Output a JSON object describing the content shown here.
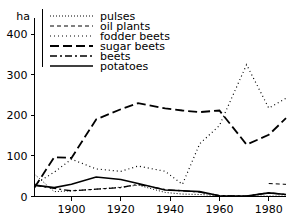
{
  "chart_data": {
    "type": "line",
    "title": "",
    "xlabel": "",
    "ylabel": "ha",
    "unit_label": "ha",
    "xlim": [
      1885,
      1987
    ],
    "ylim": [
      0,
      440
    ],
    "grid": false,
    "legend_position": "top-left",
    "xticks": [
      1900,
      1920,
      1940,
      1960,
      1980
    ],
    "xtick_labels": [
      "1900",
      "1920",
      "1940",
      "1960",
      "1980"
    ],
    "yticks": [
      0,
      100,
      200,
      300,
      400
    ],
    "ytick_labels": [
      "0",
      "100",
      "200",
      "300",
      "400"
    ],
    "series": [
      {
        "name": "pulses",
        "dash": "fine-dots",
        "dasharray": "1,2",
        "width": 1,
        "x": [
          1885,
          1893,
          1900,
          1910,
          1920,
          1927,
          1938,
          1945,
          1952,
          1960,
          1971,
          1980,
          1987
        ],
        "values": [
          55,
          12,
          14,
          18,
          23,
          28,
          10,
          6,
          5,
          2,
          1,
          1,
          1
        ]
      },
      {
        "name": "oil plants",
        "dash": "short-dashes",
        "dasharray": "4,3",
        "width": 1,
        "x": [
          1980,
          1987
        ],
        "values": [
          32,
          30
        ]
      },
      {
        "name": "fodder beets",
        "dash": "sparse-dots",
        "dasharray": "1,3",
        "width": 1.2,
        "x": [
          1885,
          1893,
          1900,
          1910,
          1920,
          1927,
          1938,
          1945,
          1952,
          1960,
          1971,
          1980,
          1987
        ],
        "values": [
          30,
          60,
          92,
          68,
          62,
          75,
          62,
          30,
          130,
          175,
          325,
          218,
          242
        ]
      },
      {
        "name": "sugar beets",
        "dash": "long-dashes",
        "dasharray": "9,4",
        "width": 1.8,
        "x": [
          1885,
          1893,
          1900,
          1910,
          1920,
          1927,
          1938,
          1945,
          1952,
          1960,
          1971,
          1980,
          1987
        ],
        "values": [
          22,
          97,
          95,
          190,
          215,
          230,
          217,
          212,
          208,
          212,
          128,
          152,
          193
        ]
      },
      {
        "name": "beets",
        "dash": "dash-dot",
        "dasharray": "7,3,2,3",
        "width": 1.3,
        "x": [
          1885,
          1893,
          1900,
          1910,
          1920,
          1927,
          1938,
          1945,
          1952,
          1960,
          1971,
          1980,
          1987
        ],
        "values": [
          28,
          20,
          14,
          18,
          22,
          30,
          17,
          14,
          11,
          2,
          1,
          9,
          5
        ]
      },
      {
        "name": "potatoes",
        "dash": "solid",
        "dasharray": "",
        "width": 1.6,
        "x": [
          1885,
          1893,
          1900,
          1910,
          1920,
          1927,
          1938,
          1945,
          1952,
          1960,
          1971,
          1980,
          1987
        ],
        "values": [
          28,
          22,
          30,
          48,
          42,
          32,
          16,
          14,
          12,
          2,
          1,
          9,
          5
        ]
      }
    ]
  },
  "legend": {
    "entries": [
      {
        "label": "pulses"
      },
      {
        "label": "oil plants"
      },
      {
        "label": "fodder beets"
      },
      {
        "label": "sugar beets"
      },
      {
        "label": "beets"
      },
      {
        "label": "potatoes"
      }
    ]
  }
}
